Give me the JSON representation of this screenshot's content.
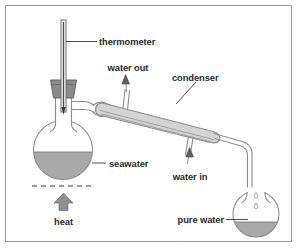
{
  "figure": {
    "background_color": "#ffffff",
    "border_color": "#9a9a9a",
    "glass_outline_color": "#8d8d8d",
    "liquid_color": "#a8a8a8",
    "label_color": "#2b2b2b",
    "stopper_color": "#8a8a8a",
    "arrow_color": "#8f8f8f"
  },
  "labels": {
    "thermometer": "thermometer",
    "water_out": "water out",
    "condenser": "condenser",
    "seawater": "seawater",
    "water_in": "water in",
    "heat": "heat",
    "pure_water": "pure water"
  },
  "components": [
    {
      "name": "thermometer",
      "label": "thermometer"
    },
    {
      "name": "rubber-stopper",
      "label": ""
    },
    {
      "name": "boiling-flask",
      "label": "seawater"
    },
    {
      "name": "still-head-adapter",
      "label": ""
    },
    {
      "name": "condenser",
      "label": "condenser"
    },
    {
      "name": "condenser-water-outlet",
      "label": "water out"
    },
    {
      "name": "condenser-water-inlet",
      "label": "water in"
    },
    {
      "name": "delivery-tube",
      "label": ""
    },
    {
      "name": "receiving-flask",
      "label": "pure water"
    },
    {
      "name": "heat-source",
      "label": "heat"
    }
  ],
  "liquids": [
    {
      "name": "seawater",
      "vessel": "boiling-flask",
      "fill_level": "45%",
      "color": "#a8a8a8"
    },
    {
      "name": "pure-water",
      "vessel": "receiving-flask",
      "fill_level": "20%",
      "color": "#a8a8a8"
    }
  ],
  "flow_arrows": [
    {
      "name": "water-out-arrow",
      "direction": "up",
      "label": "water out"
    },
    {
      "name": "water-in-arrow",
      "direction": "up",
      "label": "water in"
    },
    {
      "name": "heat-arrow",
      "direction": "up",
      "label": "heat"
    }
  ]
}
